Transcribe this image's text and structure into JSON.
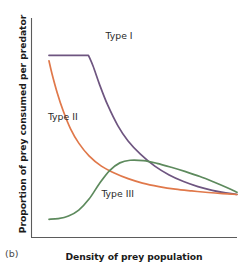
{
  "figure": {
    "panel_label": "(b)",
    "background_color": "#ffffff",
    "axis_color": "#5b5b5b"
  },
  "chart_data": {
    "type": "line",
    "title": "",
    "subtitle": "",
    "xlabel": "Density of prey population",
    "ylabel": "Proportion of prey consumed per predator",
    "xlim": [
      0,
      1
    ],
    "ylim": [
      0,
      1
    ],
    "grid": false,
    "legend": "inline-annotations",
    "xticks": [],
    "yticks": [],
    "annotations": [
      {
        "text": "Type I",
        "x": 0.36,
        "y": 0.905,
        "color": "#2a2a2a"
      },
      {
        "text": "Type II",
        "x": 0.08,
        "y": 0.535,
        "color": "#2a2a2a"
      },
      {
        "text": "Type III",
        "x": 0.34,
        "y": 0.185,
        "color": "#2a2a2a"
      }
    ],
    "series": [
      {
        "name": "Type I",
        "color": "#6e5580",
        "description": "Linear plateau then sharp hyperbolic decline",
        "x": [
          0.085,
          0.125,
          0.175,
          0.225,
          0.277,
          0.277,
          0.3,
          0.33,
          0.37,
          0.42,
          0.47,
          0.53,
          0.6,
          0.67,
          0.74,
          0.81,
          0.88,
          0.945,
          1.0
        ],
        "y": [
          0.83,
          0.83,
          0.83,
          0.83,
          0.83,
          0.83,
          0.78,
          0.7,
          0.605,
          0.51,
          0.44,
          0.38,
          0.325,
          0.285,
          0.255,
          0.232,
          0.215,
          0.203,
          0.196
        ]
      },
      {
        "name": "Type II",
        "color": "#e0784a",
        "description": "Decelerating hyperbolic (Michaelis-Menten) decline",
        "x": [
          0.085,
          0.1,
          0.125,
          0.155,
          0.19,
          0.23,
          0.28,
          0.34,
          0.4,
          0.47,
          0.54,
          0.62,
          0.7,
          0.78,
          0.86,
          0.93,
          1.0
        ],
        "y": [
          0.805,
          0.745,
          0.66,
          0.575,
          0.495,
          0.43,
          0.372,
          0.325,
          0.295,
          0.268,
          0.248,
          0.232,
          0.22,
          0.212,
          0.205,
          0.2,
          0.196
        ]
      },
      {
        "name": "Type III",
        "color": "#5d8a5d",
        "description": "Sigmoidal rise to a peak then gentle decline",
        "x": [
          0.085,
          0.13,
          0.18,
          0.23,
          0.28,
          0.33,
          0.38,
          0.43,
          0.48,
          0.545,
          0.61,
          0.68,
          0.75,
          0.82,
          0.89,
          0.95,
          1.0
        ],
        "y": [
          0.083,
          0.086,
          0.098,
          0.125,
          0.175,
          0.245,
          0.305,
          0.34,
          0.352,
          0.35,
          0.338,
          0.32,
          0.3,
          0.278,
          0.252,
          0.228,
          0.206
        ]
      }
    ]
  }
}
